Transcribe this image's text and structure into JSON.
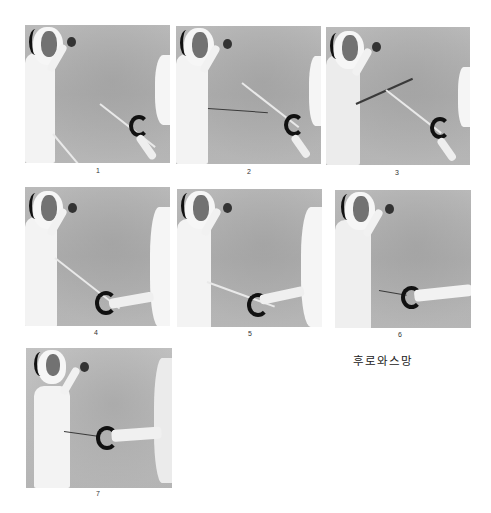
{
  "figure": {
    "caption": "후로와스망",
    "panels": [
      {
        "number": "1",
        "x": 25,
        "y": 25,
        "w": 145,
        "h": 138
      },
      {
        "number": "2",
        "x": 176,
        "y": 26,
        "w": 145,
        "h": 138
      },
      {
        "number": "3",
        "x": 326,
        "y": 27,
        "w": 144,
        "h": 138
      },
      {
        "number": "4",
        "x": 25,
        "y": 187,
        "w": 145,
        "h": 139
      },
      {
        "number": "5",
        "x": 177,
        "y": 189,
        "w": 145,
        "h": 138
      },
      {
        "number": "6",
        "x": 335,
        "y": 190,
        "w": 136,
        "h": 138
      },
      {
        "number": "7",
        "x": 26,
        "y": 348,
        "w": 146,
        "h": 140
      }
    ]
  },
  "colors": {
    "background": "#ffffff",
    "photo_gray": "#b0b0b0",
    "suit": "#f3f3f3",
    "dark": "#111111"
  }
}
